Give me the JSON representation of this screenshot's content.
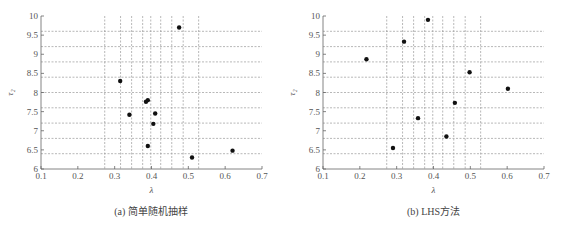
{
  "chart_data": [
    {
      "type": "scatter",
      "title": "",
      "caption": "(a) 简单随机抽样",
      "xlabel": "λ",
      "ylabel": "τ₂",
      "xlim": [
        0.1,
        0.7
      ],
      "ylim": [
        6,
        10
      ],
      "xticks": [
        "0.1",
        "0.2",
        "0.3",
        "0.4",
        "0.5",
        "0.6",
        "0.7"
      ],
      "yticks": [
        "6",
        "6.5",
        "7",
        "7.5",
        "8",
        "8.5",
        "9",
        "9.5",
        "10"
      ],
      "grid": true,
      "grid_style": "dashed",
      "x_grid_lines": [
        0.273,
        0.316,
        0.346,
        0.376,
        0.398,
        0.425,
        0.455,
        0.486,
        0.528
      ],
      "y_grid_lines": [
        6.4,
        6.8,
        7.2,
        7.6,
        8.0,
        8.4,
        8.8,
        9.2,
        9.6
      ],
      "x": [
        0.475,
        0.315,
        0.385,
        0.39,
        0.34,
        0.41,
        0.405,
        0.39,
        0.51,
        0.62
      ],
      "y": [
        9.7,
        8.3,
        7.76,
        7.8,
        7.42,
        7.45,
        7.18,
        6.6,
        6.3,
        6.48
      ]
    },
    {
      "type": "scatter",
      "title": "",
      "caption": "(b) LHS方法",
      "xlabel": "λ",
      "ylabel": "τ₂",
      "xlim": [
        0.1,
        0.7
      ],
      "ylim": [
        6,
        10
      ],
      "xticks": [
        "0.1",
        "0.2",
        "0.3",
        "0.4",
        "0.5",
        "0.6",
        "0.7"
      ],
      "yticks": [
        "6",
        "6.5",
        "7",
        "7.5",
        "8",
        "8.5",
        "9",
        "9.5",
        "10"
      ],
      "grid": true,
      "grid_style": "dashed",
      "x_grid_lines": [
        0.273,
        0.316,
        0.346,
        0.376,
        0.398,
        0.425,
        0.455,
        0.486,
        0.528
      ],
      "y_grid_lines": [
        6.4,
        6.8,
        7.2,
        7.6,
        8.0,
        8.4,
        8.8,
        9.2,
        9.6
      ],
      "x": [
        0.385,
        0.32,
        0.218,
        0.498,
        0.602,
        0.458,
        0.358,
        0.435,
        0.29
      ],
      "y": [
        9.9,
        9.33,
        8.87,
        8.53,
        8.1,
        7.73,
        7.33,
        6.85,
        6.55
      ]
    }
  ],
  "colors": {
    "axis": "#666666",
    "grid": "#9a9a9a",
    "point": "#111111",
    "text": "#555555"
  }
}
